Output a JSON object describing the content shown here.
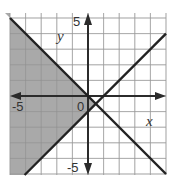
{
  "chart_data": {
    "type": "line",
    "title": "",
    "xlabel": "x",
    "ylabel": "y",
    "xlim": [
      -5,
      5
    ],
    "ylim": [
      -5,
      5
    ],
    "grid": true,
    "tick_labels": {
      "x_min": "-5",
      "y_max": "5",
      "y_min": "-5",
      "origin": "0"
    },
    "series": [
      {
        "name": "y = -x",
        "slope": -1,
        "intercept": 0,
        "style": "solid"
      },
      {
        "name": "y = x - 1",
        "slope": 1,
        "intercept": -1,
        "style": "solid"
      }
    ],
    "shaded_region": {
      "description": "region left of both lines: y <= -x and y >= x - 1",
      "fill": "#a9a9a9"
    },
    "colors": {
      "grid": "#d9d9d9",
      "axes": "#2b2b2b",
      "lines": "#222222",
      "shade": "#a9a9a9"
    }
  }
}
